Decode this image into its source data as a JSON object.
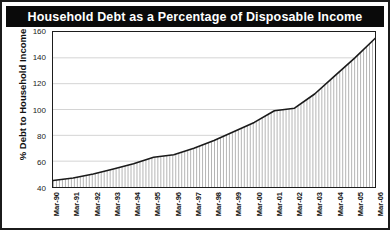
{
  "chart_data": {
    "type": "area",
    "title": "Household Debt as a Percentage of Disposable Income",
    "xlabel": "",
    "ylabel": "% Debt to Household Income",
    "ylim": [
      40,
      160
    ],
    "yticks": [
      40,
      60,
      80,
      100,
      120,
      140,
      160
    ],
    "grid": true,
    "legend": "none",
    "fill": "vertical-hatch",
    "line_color": "#1a1a1a",
    "categories": [
      "Mar-90",
      "Mar-91",
      "Mar-92",
      "Mar-93",
      "Mar-94",
      "Mar-95",
      "Mar-96",
      "Mar-97",
      "Mar-98",
      "Mar-99",
      "Mar-00",
      "Mar-01",
      "Mar-02",
      "Mar-03",
      "Mar-04",
      "Mar-05",
      "Mar-06"
    ],
    "values": [
      45,
      47,
      50,
      54,
      58,
      63,
      65,
      70,
      76,
      83,
      90,
      99,
      101,
      112,
      126,
      140,
      155
    ],
    "x": [
      1990,
      1991,
      1992,
      1993,
      1994,
      1995,
      1996,
      1997,
      1998,
      1999,
      2000,
      2001,
      2002,
      2003,
      2004,
      2005,
      2006
    ],
    "series": [
      {
        "name": "% Debt to Household Income",
        "values": [
          45,
          47,
          50,
          54,
          58,
          63,
          65,
          70,
          76,
          83,
          90,
          99,
          101,
          112,
          126,
          140,
          155
        ]
      }
    ],
    "annotations": []
  },
  "style": {
    "title_bg": "#0a0a0a",
    "title_fg": "#ffffff",
    "frame_border": "#1b1b1b",
    "plot_bg": "#ffffff",
    "grid_color": "#c9c9c9"
  }
}
